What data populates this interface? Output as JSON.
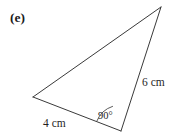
{
  "figure": {
    "part_label": "(e)",
    "shape": "right-triangle",
    "background_color": "#ffffff",
    "stroke_color": "#3a3a3a",
    "stroke_width": 1,
    "vertices": {
      "left": {
        "x": 33,
        "y": 97
      },
      "apex": {
        "x": 161,
        "y": 7
      },
      "right_angle": {
        "x": 121,
        "y": 131
      }
    },
    "sides": [
      {
        "name": "base",
        "label": "4 cm",
        "from": "left",
        "to": "right_angle"
      },
      {
        "name": "vertical",
        "label": "6 cm",
        "from": "right_angle",
        "to": "apex"
      },
      {
        "name": "hypotenuse",
        "label": "",
        "from": "left",
        "to": "apex"
      }
    ],
    "angle_marks": [
      {
        "at": "right_angle",
        "label": "90°",
        "radius": 26
      }
    ]
  },
  "labels": {
    "side_base": "4 cm",
    "side_vertical": "6 cm",
    "angle_right": "90°"
  }
}
